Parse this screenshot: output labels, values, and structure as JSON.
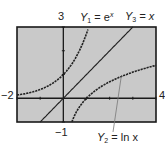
{
  "chart_data": {
    "type": "line",
    "title": "",
    "xlabel": "",
    "ylabel": "",
    "xlim": [
      -2,
      4
    ],
    "ylim": [
      -1,
      3
    ],
    "grid": false,
    "tick_labels": {
      "xmin": "−2",
      "xmax": "4",
      "ymin": "−1",
      "ymax": "3"
    },
    "series": [
      {
        "name": "Y1 = e^x",
        "function": "exp",
        "style": "dotted-dark",
        "x": [
          -2,
          -1.5,
          -1,
          -0.5,
          0,
          0.5,
          1,
          1.1
        ],
        "y": [
          0.135,
          0.223,
          0.368,
          0.607,
          1.0,
          1.649,
          2.718,
          3.0
        ]
      },
      {
        "name": "Y2 = ln x",
        "function": "ln",
        "style": "dotted-dark",
        "x": [
          0.37,
          0.5,
          1,
          1.5,
          2,
          3,
          4
        ],
        "y": [
          -1.0,
          -0.693,
          0,
          0.405,
          0.693,
          1.099,
          1.386
        ]
      },
      {
        "name": "Y3 = x",
        "function": "identity",
        "style": "solid-dark",
        "x": [
          -1,
          3
        ],
        "y": [
          -1,
          3
        ]
      }
    ],
    "annotations": [
      {
        "text": "Y1 = e^x",
        "position": "top"
      },
      {
        "text": "Y3 = x",
        "position": "top-right"
      },
      {
        "text": "Y2 = ln x",
        "position": "bottom-right",
        "arrow_to": [
          2.5,
          0.92
        ]
      }
    ]
  },
  "labels": {
    "ymax": "3",
    "ymin": "−1",
    "xmin": "−2",
    "xmax": "4",
    "y1_name": "Y",
    "y1_sub": "1",
    "y1_eq": " = e",
    "y1_sup": "x",
    "y3_name": "Y",
    "y3_sub": "3",
    "y3_eq": " = x",
    "y2_name": "Y",
    "y2_sub": "2",
    "y2_eq": " = ln x"
  },
  "colors": {
    "screen_bg": "#c9c9c9",
    "frame": "#1a1a1a",
    "curve": "#222222",
    "axis": "#1a1a1a",
    "leader": "#777777"
  }
}
